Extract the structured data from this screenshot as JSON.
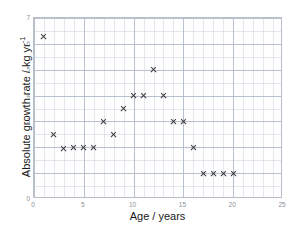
{
  "chart_data": {
    "type": "scatter",
    "title": "",
    "xlabel": "Age / years",
    "ylabel": "Absolute growth rate / kg yr",
    "ylabel_exponent": "-1",
    "xlim": [
      0,
      25
    ],
    "ylim": [
      0,
      7
    ],
    "xticks": [
      "0",
      "5",
      "10",
      "15",
      "20",
      "25"
    ],
    "xtick_values": [
      0,
      5,
      10,
      15,
      20,
      25
    ],
    "yticks": [
      "0",
      "1",
      "2",
      "3",
      "4",
      "5",
      "6",
      "7"
    ],
    "ytick_values": [
      0,
      1,
      2,
      3,
      4,
      5,
      6,
      7
    ],
    "grid": true,
    "minor_grid": true,
    "legend": "none",
    "marker": "x",
    "marker_color": "#3c3c3c",
    "x": [
      1,
      2,
      3,
      4,
      5,
      6,
      7,
      8,
      9,
      10,
      11,
      12,
      13,
      14,
      15,
      16,
      17,
      18,
      19,
      20
    ],
    "y": [
      6.3,
      2.5,
      1.95,
      2.0,
      2.0,
      2.0,
      3.0,
      2.5,
      3.5,
      4.0,
      4.0,
      5.0,
      4.0,
      3.0,
      3.0,
      2.0,
      1.0,
      1.0,
      1.0,
      1.0
    ],
    "points": [
      {
        "x": 1,
        "y": 6.3
      },
      {
        "x": 2,
        "y": 2.5
      },
      {
        "x": 3,
        "y": 1.95
      },
      {
        "x": 4,
        "y": 2.0
      },
      {
        "x": 5,
        "y": 2.0
      },
      {
        "x": 6,
        "y": 2.0
      },
      {
        "x": 7,
        "y": 3.0
      },
      {
        "x": 8,
        "y": 2.5
      },
      {
        "x": 9,
        "y": 3.5
      },
      {
        "x": 10,
        "y": 4.0
      },
      {
        "x": 11,
        "y": 4.0
      },
      {
        "x": 12,
        "y": 5.0
      },
      {
        "x": 13,
        "y": 4.0
      },
      {
        "x": 14,
        "y": 3.0
      },
      {
        "x": 15,
        "y": 3.0
      },
      {
        "x": 16,
        "y": 2.0
      },
      {
        "x": 17,
        "y": 1.0
      },
      {
        "x": 18,
        "y": 1.0
      },
      {
        "x": 19,
        "y": 1.0
      },
      {
        "x": 20,
        "y": 1.0
      }
    ]
  }
}
